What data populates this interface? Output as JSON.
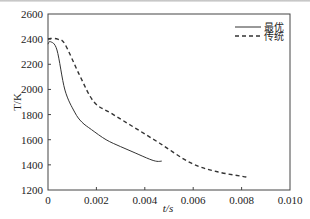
{
  "chart_data": {
    "type": "line",
    "title": "",
    "xlabel": "t/s",
    "ylabel": "T/K",
    "xlim": [
      0,
      0.01
    ],
    "ylim": [
      1200,
      2600
    ],
    "x_ticks": [
      0,
      0.002,
      0.004,
      0.006,
      0.008,
      0.01
    ],
    "x_tick_labels": [
      "0",
      "0.002",
      "0.004",
      "0.006",
      "0.008",
      "0.010"
    ],
    "y_ticks": [
      1200,
      1400,
      1600,
      1800,
      2000,
      2200,
      2400,
      2600
    ],
    "y_tick_labels": [
      "1200",
      "1400",
      "1600",
      "1800",
      "2000",
      "2200",
      "2400",
      "2600"
    ],
    "grid": false,
    "legend_position": "upper right",
    "series": [
      {
        "name": "最优",
        "style": "solid",
        "color": "#333333",
        "x": [
          0,
          0.0001,
          0.00037,
          0.0007,
          0.0011,
          0.0014,
          0.0018,
          0.0024,
          0.003,
          0.0036,
          0.0042,
          0.0045,
          0.0047
        ],
        "y": [
          2360,
          2380,
          2314,
          1995,
          1820,
          1740,
          1680,
          1600,
          1545,
          1495,
          1445,
          1428,
          1430
        ]
      },
      {
        "name": "传统",
        "style": "dashed",
        "color": "#333333",
        "x": [
          0,
          0.0001,
          0.0004,
          0.0007,
          0.0013,
          0.0019,
          0.0026,
          0.0034,
          0.0046,
          0.0059,
          0.007,
          0.0082
        ],
        "y": [
          2400,
          2405,
          2400,
          2360,
          2115,
          1900,
          1812,
          1717,
          1574,
          1415,
          1345,
          1303
        ]
      }
    ]
  }
}
